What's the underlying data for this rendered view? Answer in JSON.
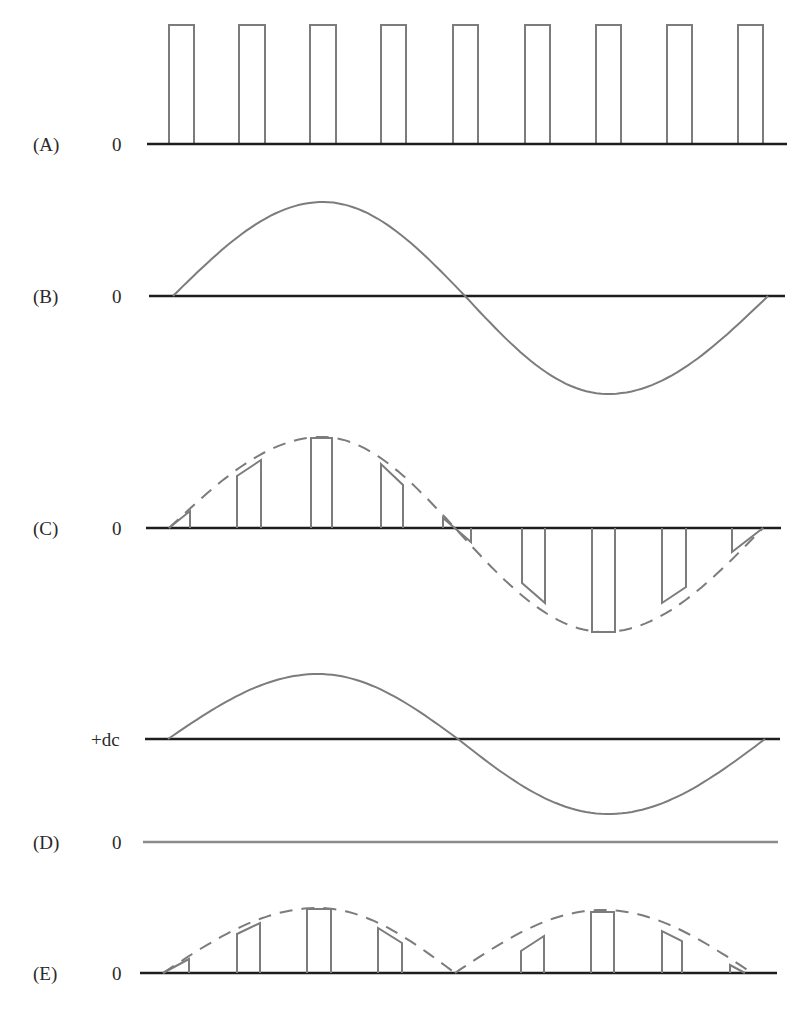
{
  "figure": {
    "panels": [
      {
        "id": "A",
        "label": "(A)",
        "axis_label": "0",
        "description": "sampling pulse train"
      },
      {
        "id": "B",
        "label": "(B)",
        "axis_label": "0",
        "description": "analog sine input signal"
      },
      {
        "id": "C",
        "label": "(C)",
        "axis_label": "0",
        "description": "bipolar PAM samples with dashed sine envelope"
      },
      {
        "id": "D",
        "label": "(D)",
        "axis_label": "0",
        "dc_label": "+dc",
        "description": "sine signal offset by dc level"
      },
      {
        "id": "E",
        "label": "(E)",
        "axis_label": "0",
        "description": "unipolar (rectified) PAM samples with dashed envelope"
      }
    ]
  },
  "colors": {
    "background": "#ffffff",
    "baseline": "#1e1e1e",
    "waveform": "#7c7c7c",
    "text": "#2a2a2a"
  },
  "chart_data": [
    {
      "panel": "A",
      "type": "pulse_train",
      "title": "(A)",
      "baseline_label": "0",
      "baseline": {
        "y": 144,
        "x1": 147,
        "x2": 787
      },
      "pulse_height_px": 119,
      "pulses": [
        {
          "x1": 169,
          "x2": 194
        },
        {
          "x1": 239,
          "x2": 265
        },
        {
          "x1": 310,
          "x2": 336
        },
        {
          "x1": 381,
          "x2": 406
        },
        {
          "x1": 453,
          "x2": 478
        },
        {
          "x1": 525,
          "x2": 550
        },
        {
          "x1": 596,
          "x2": 621
        },
        {
          "x1": 667,
          "x2": 692
        },
        {
          "x1": 738,
          "x2": 763
        }
      ]
    },
    {
      "panel": "B",
      "type": "line",
      "title": "(B)",
      "baseline_label": "0",
      "baseline": {
        "y": 296,
        "x1": 149,
        "x2": 785
      },
      "curve": {
        "x_start": 173,
        "x_end": 768,
        "zero_cross": 465,
        "peak": {
          "x": 323,
          "y": 202
        },
        "trough": {
          "x": 608,
          "y": 394
        }
      }
    },
    {
      "panel": "C",
      "type": "bar",
      "title": "(C)",
      "baseline_label": "0",
      "baseline": {
        "y": 528,
        "x1": 146,
        "x2": 781
      },
      "envelope": {
        "x_start": 169,
        "x_end": 763,
        "zero_cross": 455,
        "peak": {
          "x": 322,
          "y": 437
        },
        "trough": {
          "x": 604,
          "y": 632
        },
        "dashed": true
      },
      "samples": [
        {
          "x1": 169,
          "x2": 190,
          "y1": 528,
          "y2": 511
        },
        {
          "x1": 237,
          "x2": 261,
          "y1": 476,
          "y2": 460
        },
        {
          "x1": 311,
          "x2": 332,
          "y1": 438,
          "y2": 438
        },
        {
          "x1": 381,
          "x2": 403,
          "y1": 464,
          "y2": 485
        },
        {
          "x1": 443,
          "x2": 471,
          "y1": 518,
          "y2": 542
        },
        {
          "x1": 522,
          "x2": 545,
          "y1": 583,
          "y2": 603
        },
        {
          "x1": 592,
          "x2": 615,
          "y1": 632,
          "y2": 632
        },
        {
          "x1": 662,
          "x2": 686,
          "y1": 603,
          "y2": 587
        },
        {
          "x1": 732,
          "x2": 763,
          "y1": 552,
          "y2": 528
        }
      ]
    },
    {
      "panel": "D",
      "type": "line",
      "title": "(D)",
      "baseline_label": "0",
      "dc_label": "+dc",
      "dc_line": {
        "y": 739,
        "x1": 145,
        "x2": 780
      },
      "zero_line": {
        "y": 842,
        "x1": 143,
        "x2": 778
      },
      "curve": {
        "x_start": 168,
        "x_end": 765,
        "zero_cross": 458,
        "peak": {
          "x": 318,
          "y": 674
        },
        "trough": {
          "x": 608,
          "y": 814
        }
      }
    },
    {
      "panel": "E",
      "type": "bar",
      "title": "(E)",
      "baseline_label": "0",
      "baseline": {
        "y": 973,
        "x1": 140,
        "x2": 777
      },
      "envelope": {
        "humps": [
          {
            "x_start": 163,
            "x_end": 455,
            "peak": {
              "x": 318,
              "y": 908
            }
          },
          {
            "x_start": 455,
            "x_end": 752,
            "peak": {
              "x": 603,
              "y": 910
            }
          }
        ],
        "dashed": true
      },
      "samples": [
        {
          "x1": 163,
          "x2": 189,
          "y1": 973,
          "y2": 959
        },
        {
          "x1": 237,
          "x2": 260,
          "y1": 934,
          "y2": 923
        },
        {
          "x1": 307,
          "x2": 331,
          "y1": 909,
          "y2": 909
        },
        {
          "x1": 378,
          "x2": 402,
          "y1": 928,
          "y2": 943
        },
        {
          "x1": 521,
          "x2": 544,
          "y1": 951,
          "y2": 936
        },
        {
          "x1": 591,
          "x2": 614,
          "y1": 912,
          "y2": 912
        },
        {
          "x1": 662,
          "x2": 682,
          "y1": 931,
          "y2": 941
        },
        {
          "x1": 730,
          "x2": 745,
          "y1": 965,
          "y2": 973
        }
      ]
    }
  ]
}
